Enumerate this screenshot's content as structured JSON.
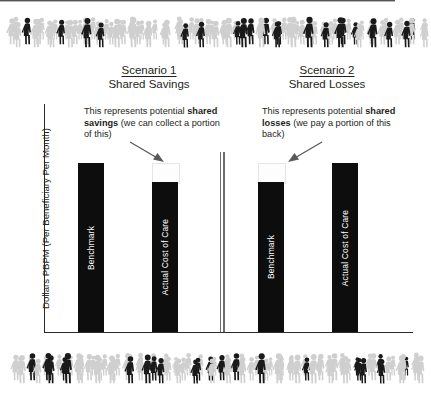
{
  "chart_data": {
    "type": "bar",
    "title": "",
    "xlabel": "",
    "ylabel": "Dollars PBPM (Per Beneficiary Per Month)",
    "grid": false,
    "legend": "none",
    "panels": [
      {
        "name": "Scenario 1",
        "subtitle": "Shared Savings",
        "categories": [
          "Benchmark",
          "Actual Cost of Care"
        ],
        "values": [
          100,
          88
        ],
        "gap_label": "shared savings"
      },
      {
        "name": "Scenario 2",
        "subtitle": "Shared Losses",
        "categories": [
          "Benchmark",
          "Actual Cost of Care"
        ],
        "values": [
          88,
          100
        ],
        "gap_label": "shared losses"
      }
    ]
  },
  "scenario_1": {
    "title": "Scenario 1",
    "subtitle": "Shared Savings",
    "callout": {
      "lead": "This represents potential",
      "emphasis": "shared savings",
      "tail": "(we can collect a portion of this)"
    },
    "bars": {
      "benchmark_label": "Benchmark",
      "actual_label": "Actual Cost of Care"
    }
  },
  "scenario_2": {
    "title": "Scenario 2",
    "subtitle": "Shared Losses",
    "callout": {
      "lead": "This represents potential",
      "emphasis": "shared losses",
      "tail": "(we pay a portion of this back)"
    },
    "bars": {
      "benchmark_label": "Benchmark",
      "actual_label": "Actual Cost of Care"
    }
  },
  "axis": {
    "y_label": "Dollars PBPM (Per Beneficiary Per Month)"
  },
  "decor": {
    "crowd_top": "crowd-of-people-graphic",
    "crowd_bottom": "crowd-of-people-graphic"
  },
  "colors": {
    "bar": "#0d0d0d",
    "text": "#231f20",
    "crowd_light": "#cfcfcf",
    "crowd_dark": "#1a1a1a",
    "axis": "#2b2b2b"
  }
}
